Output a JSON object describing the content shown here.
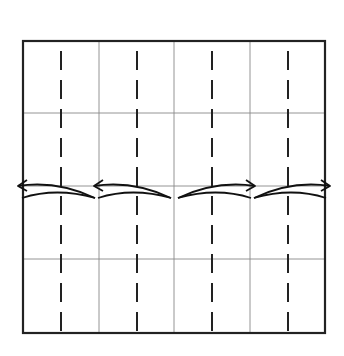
{
  "diagram": {
    "type": "origami-fold-diagram",
    "colors": {
      "background": "#ffffff",
      "border": "#222222",
      "grid": "#888888",
      "fold_line": "#222222",
      "arrow": "#111111"
    },
    "square": {
      "x1": 23,
      "y1": 41,
      "x2": 325,
      "y2": 333
    },
    "grid_lines": {
      "vertical": [
        99,
        174,
        250
      ],
      "horizontal": [
        113,
        186,
        259
      ]
    },
    "valley_folds": [
      61,
      137,
      212,
      288
    ],
    "arrows": [
      {
        "name": "arrow-left-outer",
        "direction": "left",
        "from_x": 95,
        "to_x": 18,
        "y": 186
      },
      {
        "name": "arrow-left-inner",
        "direction": "left",
        "from_x": 171,
        "to_x": 94,
        "y": 186
      },
      {
        "name": "arrow-right-inner",
        "direction": "right",
        "from_x": 178,
        "to_x": 255,
        "y": 186
      },
      {
        "name": "arrow-right-outer",
        "direction": "right",
        "from_x": 254,
        "to_x": 330,
        "y": 186
      }
    ]
  }
}
